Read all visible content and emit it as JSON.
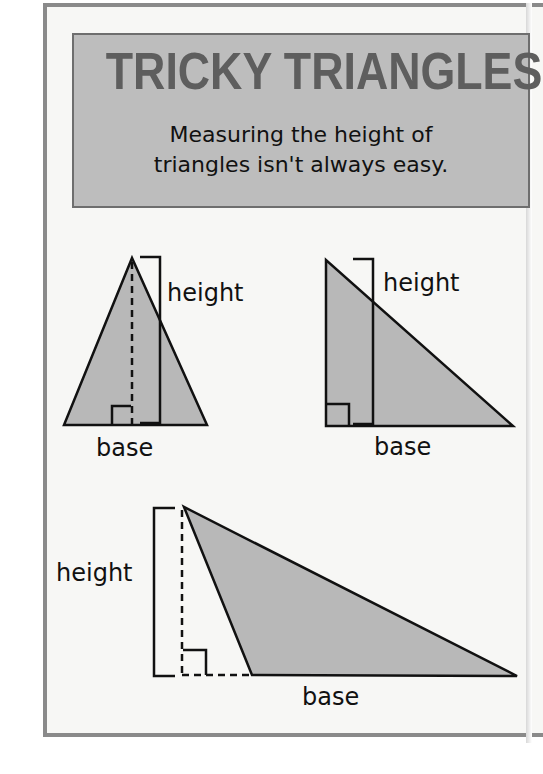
{
  "header": {
    "title": "TRICKY TRIANGLES",
    "subtitle_line1": "Measuring the height of",
    "subtitle_line2": "triangles isn't always easy."
  },
  "diagrams": [
    {
      "name": "acute-isosceles-triangle",
      "height_label": "height",
      "base_label": "base",
      "vertices": [
        [
          132,
          258
        ],
        [
          64,
          425
        ],
        [
          207,
          425
        ]
      ]
    },
    {
      "name": "right-triangle",
      "height_label": "height",
      "base_label": "base",
      "vertices": [
        [
          326,
          260
        ],
        [
          326,
          426
        ],
        [
          513,
          426
        ]
      ]
    },
    {
      "name": "obtuse-triangle",
      "height_label": "height",
      "base_label": "base",
      "vertices": [
        [
          184,
          507
        ],
        [
          252,
          675
        ],
        [
          517,
          676
        ]
      ]
    }
  ],
  "colors": {
    "title": "#5e5e5e",
    "title_box": "#bdbdbd",
    "triangle_fill": "#b8b8b8",
    "stroke": "#111111",
    "frame": "#8a8a8a"
  }
}
